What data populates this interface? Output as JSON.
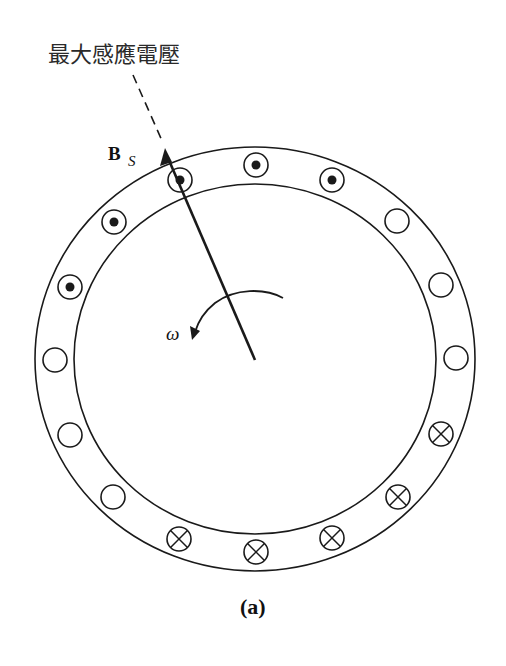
{
  "title_label": "最大感應電壓",
  "field_vector": {
    "symbol": "B",
    "subscript": "S"
  },
  "rotation_label": "ω",
  "caption": "(a)",
  "colors": {
    "ink": "#1a1a1a",
    "background": "#ffffff"
  },
  "stator": {
    "center": [
      255,
      359
    ],
    "outer_radius": [
      220,
      212
    ],
    "inner_radius": [
      181,
      175
    ],
    "slot_radius": 12
  },
  "slots": [
    {
      "x": 256,
      "y": 165,
      "type": "dot"
    },
    {
      "x": 332,
      "y": 180,
      "type": "dot"
    },
    {
      "x": 397,
      "y": 221,
      "type": "empty"
    },
    {
      "x": 441,
      "y": 285,
      "type": "empty"
    },
    {
      "x": 456,
      "y": 358,
      "type": "empty"
    },
    {
      "x": 441,
      "y": 434,
      "type": "cross"
    },
    {
      "x": 398,
      "y": 497,
      "type": "cross"
    },
    {
      "x": 332,
      "y": 538,
      "type": "cross"
    },
    {
      "x": 256,
      "y": 552,
      "type": "cross"
    },
    {
      "x": 179,
      "y": 539,
      "type": "cross"
    },
    {
      "x": 113,
      "y": 497,
      "type": "empty"
    },
    {
      "x": 70,
      "y": 435,
      "type": "empty"
    },
    {
      "x": 55,
      "y": 360,
      "type": "empty"
    },
    {
      "x": 70,
      "y": 287,
      "type": "dot"
    },
    {
      "x": 114,
      "y": 222,
      "type": "dot"
    },
    {
      "x": 180,
      "y": 180,
      "type": "dot"
    }
  ]
}
